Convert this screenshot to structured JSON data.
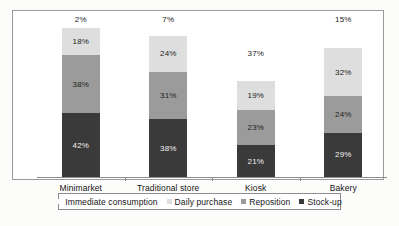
{
  "chart_data": {
    "type": "bar",
    "subtype": "stacked-100-percent",
    "title": "",
    "xlabel": "",
    "ylabel": "",
    "ylim": [
      0,
      100
    ],
    "grid": false,
    "legend_position": "bottom",
    "categories": [
      "Minimarket",
      "Traditional store",
      "Kiosk",
      "Bakery"
    ],
    "series": [
      {
        "name": "Stock-up",
        "color": "#3a3a3a",
        "values": [
          42,
          38,
          21,
          29
        ],
        "labels": [
          "42%",
          "38%",
          "21%",
          "29%"
        ]
      },
      {
        "name": "Reposition",
        "color": "#9b9b9b",
        "values": [
          38,
          31,
          23,
          24
        ],
        "labels": [
          "38%",
          "31%",
          "23%",
          "24%"
        ]
      },
      {
        "name": "Daily purchase",
        "color": "#dedede",
        "values": [
          18,
          24,
          19,
          32
        ],
        "labels": [
          "18%",
          "24%",
          "19%",
          "32%"
        ]
      },
      {
        "name": "Immediate consumption",
        "color": "#ffffff",
        "values": [
          2,
          7,
          37,
          15
        ],
        "labels": [
          "2%",
          "7%",
          "37%",
          "15%"
        ]
      }
    ]
  },
  "legend": {
    "items": [
      {
        "label": "Immediate consumption",
        "key": "k-immediate"
      },
      {
        "label": "Daily purchase",
        "key": "k-daily"
      },
      {
        "label": "Reposition",
        "key": "k-reposition"
      },
      {
        "label": "Stock-up",
        "key": "k-stockup"
      }
    ]
  }
}
